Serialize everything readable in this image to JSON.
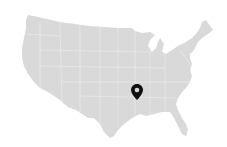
{
  "map": {
    "region": "Contiguous United States",
    "land_color": "#d9d9d9",
    "border_color": "#efefef",
    "background_color": "#ffffff"
  },
  "marker": {
    "icon": "map-pin-icon",
    "color": "#111111",
    "x": 137,
    "y": 92,
    "approx_location": "Arkansas / Tennessee area"
  }
}
